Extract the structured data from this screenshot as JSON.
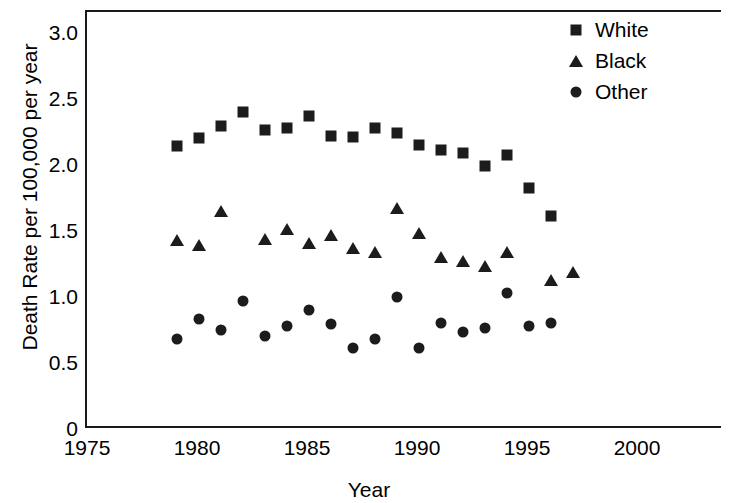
{
  "chart_data": {
    "type": "scatter",
    "title": "",
    "xlabel": "Year",
    "ylabel": "Death Rate per 100,000 per year",
    "xlim": [
      1975,
      2000
    ],
    "ylim": [
      0,
      3.0
    ],
    "xticks": [
      "1975",
      "1980",
      "1985",
      "1990",
      "1995",
      "2000"
    ],
    "yticks": [
      "0",
      "0.5",
      "1.0",
      "1.5",
      "2.0",
      "2.5",
      "3.0"
    ],
    "grid": false,
    "legend_position": "top-right",
    "x": [
      1979,
      1980,
      1981,
      1982,
      1983,
      1984,
      1985,
      1986,
      1987,
      1988,
      1989,
      1990,
      1991,
      1992,
      1993,
      1994,
      1995,
      1996,
      1997
    ],
    "series": [
      {
        "name": "White",
        "marker": "square",
        "color": "#1c1c1c",
        "values": [
          2.15,
          2.21,
          2.3,
          2.41,
          2.27,
          2.29,
          2.38,
          2.23,
          2.22,
          2.29,
          2.25,
          2.16,
          2.12,
          2.1,
          2.0,
          2.08,
          1.83,
          1.62,
          null
        ]
      },
      {
        "name": "Black",
        "marker": "triangle",
        "color": "#1c1c1c",
        "values": [
          1.44,
          1.4,
          1.66,
          null,
          1.45,
          1.52,
          1.42,
          1.48,
          1.38,
          1.35,
          1.68,
          1.49,
          1.31,
          1.28,
          1.24,
          1.35,
          null,
          1.14,
          1.2
        ]
      },
      {
        "name": "Other",
        "marker": "circle",
        "color": "#1c1c1c",
        "values": [
          0.69,
          0.84,
          0.76,
          0.98,
          0.71,
          0.79,
          0.91,
          0.8,
          0.62,
          0.69,
          1.01,
          0.62,
          0.81,
          0.74,
          0.77,
          1.04,
          0.79,
          0.81,
          null
        ]
      }
    ]
  },
  "legend": {
    "items": [
      {
        "label": "White",
        "marker": "square"
      },
      {
        "label": "Black",
        "marker": "triangle"
      },
      {
        "label": "Other",
        "marker": "circle"
      }
    ]
  }
}
